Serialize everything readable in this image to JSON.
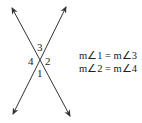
{
  "diagram": {
    "angle_labels": [
      "1",
      "2",
      "3",
      "4"
    ],
    "equations": [
      "m∠1 = m∠3",
      "m∠2 = m∠4"
    ],
    "colors": {
      "line": "#333333",
      "text": "#222222",
      "background": "#ffffff"
    }
  }
}
